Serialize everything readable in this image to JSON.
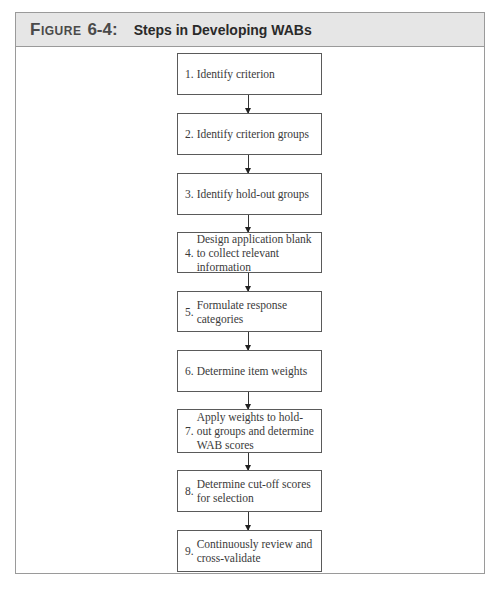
{
  "figure": {
    "label": "Figure",
    "number": "6-4:",
    "title": "Steps in Developing WABs"
  },
  "steps": [
    {
      "num": "1.",
      "text": "Identify criterion"
    },
    {
      "num": "2.",
      "text": "Identify criterion groups"
    },
    {
      "num": "3.",
      "text": "Identify hold-out groups"
    },
    {
      "num": "4.",
      "text": "Design application blank to collect relevant information"
    },
    {
      "num": "5.",
      "text": "Formulate response categories"
    },
    {
      "num": "6.",
      "text": "Determine item weights"
    },
    {
      "num": "7.",
      "text": "Apply weights to hold-out groups and determine WAB scores"
    },
    {
      "num": "8.",
      "text": "Determine cut-off scores for selection"
    },
    {
      "num": "9.",
      "text": "Continuously review and cross-validate"
    }
  ],
  "colors": {
    "header_bg": "#e6e6e6",
    "border": "#9a9a9a",
    "box_border": "#5a5a5a",
    "arrow": "#222222"
  }
}
